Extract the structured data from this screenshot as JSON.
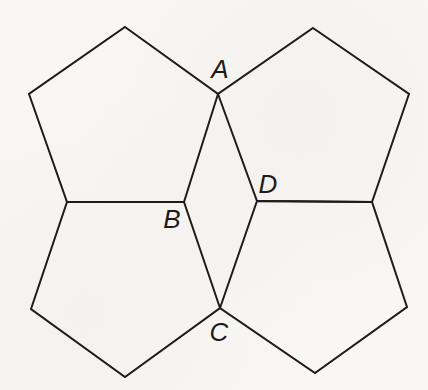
{
  "figure": {
    "canvas": {
      "width": 428,
      "height": 390,
      "background": "#f8f7f4"
    },
    "style": {
      "stroke_color": "#1d1c1a",
      "stroke_width": 2,
      "label_color": "#1d1c1a",
      "label_font_size": 26
    },
    "pentagons": [
      {
        "name": "top-left",
        "points": [
          [
            125,
            27
          ],
          [
            218,
            94
          ],
          [
            184,
            202
          ],
          [
            67,
            202
          ],
          [
            29,
            94
          ]
        ]
      },
      {
        "name": "top-right",
        "points": [
          [
            313,
            28
          ],
          [
            409,
            94
          ],
          [
            372,
            202
          ],
          [
            257,
            201
          ],
          [
            218,
            94
          ]
        ]
      },
      {
        "name": "bottom-left",
        "points": [
          [
            67,
            202
          ],
          [
            184,
            202
          ],
          [
            220,
            308
          ],
          [
            125,
            377
          ],
          [
            31,
            309
          ]
        ]
      },
      {
        "name": "bottom-right",
        "points": [
          [
            257,
            201
          ],
          [
            372,
            202
          ],
          [
            407,
            307
          ],
          [
            315,
            373
          ],
          [
            220,
            308
          ]
        ]
      }
    ],
    "vertex_labels": [
      {
        "text": "A",
        "x": 220,
        "y": 78
      },
      {
        "text": "B",
        "x": 172,
        "y": 228
      },
      {
        "text": "C",
        "x": 219,
        "y": 341
      },
      {
        "text": "D",
        "x": 268,
        "y": 193
      }
    ]
  }
}
